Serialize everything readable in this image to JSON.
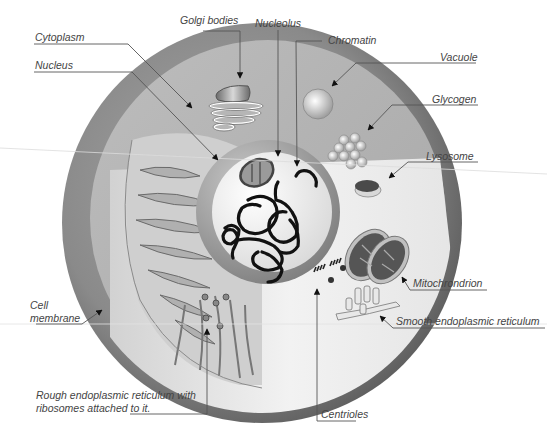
{
  "diagram": {
    "type": "animal-cell-cross-section",
    "style": "grayscale illustration",
    "labels": [
      {
        "id": "golgi",
        "text": "Golgi bodies"
      },
      {
        "id": "nucleolus",
        "text": "Nucleolus"
      },
      {
        "id": "chromatin",
        "text": "Chromatin"
      },
      {
        "id": "cytoplasm",
        "text": "Cytoplasm"
      },
      {
        "id": "nucleus",
        "text": "Nucleus"
      },
      {
        "id": "vacuole",
        "text": "Vacuole"
      },
      {
        "id": "glycogen",
        "text": "Glycogen"
      },
      {
        "id": "lysosome",
        "text": "Lysosome"
      },
      {
        "id": "mitochondrion",
        "text": "Mitochrondrion"
      },
      {
        "id": "smooth_er",
        "text": "Smooth endoplasmic reticulum"
      },
      {
        "id": "cell_membrane_1",
        "text": "Cell"
      },
      {
        "id": "cell_membrane_2",
        "text": "membrane"
      },
      {
        "id": "rough_er_1",
        "text": "Rough endoplasmic reticulum with"
      },
      {
        "id": "rough_er_2",
        "text": "ribosomes attached to it."
      },
      {
        "id": "centrioles",
        "text": "Centrioles"
      }
    ]
  },
  "colors": {
    "background": "#ffffff",
    "membrane_dark": "#6e6e6e",
    "membrane_mid": "#8c8c8c",
    "cytoplasm": "#b4b4b4",
    "cytoplasm_light": "#e6e6e6",
    "nucleus_ring": "#9a9a9a",
    "nucleus_inner": "#f6f6f6",
    "chromatin": "#111111",
    "leader_line": "#555555",
    "label_text": "#444444"
  }
}
